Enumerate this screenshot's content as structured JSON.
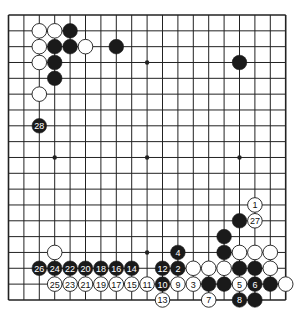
{
  "board": {
    "size": 19,
    "colors": {
      "background": "#ffffff",
      "line": "#222222",
      "black_stone": "#1a1a1a",
      "white_stone": "#ffffff",
      "black_label": "#ffffff",
      "white_label": "#111111"
    },
    "star_points": [
      [
        3,
        3
      ],
      [
        9,
        3
      ],
      [
        15,
        3
      ],
      [
        3,
        9
      ],
      [
        9,
        9
      ],
      [
        15,
        9
      ],
      [
        3,
        15
      ],
      [
        9,
        15
      ],
      [
        15,
        15
      ]
    ],
    "stones": [
      {
        "color": "black",
        "col": 4,
        "row": 1,
        "label": ""
      },
      {
        "color": "black",
        "col": 3,
        "row": 2,
        "label": ""
      },
      {
        "color": "black",
        "col": 4,
        "row": 2,
        "label": ""
      },
      {
        "color": "black",
        "col": 7,
        "row": 2,
        "label": ""
      },
      {
        "color": "black",
        "col": 3,
        "row": 3,
        "label": ""
      },
      {
        "color": "black",
        "col": 3,
        "row": 4,
        "label": ""
      },
      {
        "color": "black",
        "col": 15,
        "row": 3,
        "label": ""
      },
      {
        "color": "black",
        "col": 15,
        "row": 13,
        "label": ""
      },
      {
        "color": "black",
        "col": 14,
        "row": 14,
        "label": ""
      },
      {
        "color": "black",
        "col": 14,
        "row": 15,
        "label": ""
      },
      {
        "color": "black",
        "col": 15,
        "row": 16,
        "label": ""
      },
      {
        "color": "black",
        "col": 16,
        "row": 16,
        "label": ""
      },
      {
        "color": "black",
        "col": 13,
        "row": 17,
        "label": ""
      },
      {
        "color": "black",
        "col": 14,
        "row": 17,
        "label": ""
      },
      {
        "color": "black",
        "col": 17,
        "row": 17,
        "label": ""
      },
      {
        "color": "black",
        "col": 16,
        "row": 18,
        "label": ""
      },
      {
        "color": "white",
        "col": 2,
        "row": 1,
        "label": ""
      },
      {
        "color": "white",
        "col": 3,
        "row": 1,
        "label": ""
      },
      {
        "color": "white",
        "col": 2,
        "row": 2,
        "label": ""
      },
      {
        "color": "white",
        "col": 5,
        "row": 2,
        "label": ""
      },
      {
        "color": "white",
        "col": 2,
        "row": 3,
        "label": ""
      },
      {
        "color": "white",
        "col": 2,
        "row": 5,
        "label": ""
      },
      {
        "color": "white",
        "col": 3,
        "row": 15,
        "label": ""
      },
      {
        "color": "white",
        "col": 15,
        "row": 15,
        "label": ""
      },
      {
        "color": "white",
        "col": 16,
        "row": 15,
        "label": ""
      },
      {
        "color": "white",
        "col": 17,
        "row": 15,
        "label": ""
      },
      {
        "color": "white",
        "col": 12,
        "row": 16,
        "label": ""
      },
      {
        "color": "white",
        "col": 13,
        "row": 16,
        "label": ""
      },
      {
        "color": "white",
        "col": 14,
        "row": 16,
        "label": ""
      },
      {
        "color": "white",
        "col": 17,
        "row": 16,
        "label": ""
      },
      {
        "color": "white",
        "col": 18,
        "row": 17,
        "label": ""
      },
      {
        "color": "white",
        "col": 16,
        "row": 12,
        "label": "1"
      },
      {
        "color": "black",
        "col": 11,
        "row": 16,
        "label": "2"
      },
      {
        "color": "white",
        "col": 12,
        "row": 17,
        "label": "3"
      },
      {
        "color": "black",
        "col": 11,
        "row": 15,
        "label": "4"
      },
      {
        "color": "white",
        "col": 15,
        "row": 17,
        "label": "5"
      },
      {
        "color": "black",
        "col": 16,
        "row": 17,
        "label": "6"
      },
      {
        "color": "white",
        "col": 13,
        "row": 18,
        "label": "7"
      },
      {
        "color": "black",
        "col": 15,
        "row": 18,
        "label": "8"
      },
      {
        "color": "white",
        "col": 11,
        "row": 17,
        "label": "9"
      },
      {
        "color": "black",
        "col": 10,
        "row": 17,
        "label": "10"
      },
      {
        "color": "white",
        "col": 9,
        "row": 17,
        "label": "11"
      },
      {
        "color": "black",
        "col": 10,
        "row": 16,
        "label": "12"
      },
      {
        "color": "white",
        "col": 10,
        "row": 18,
        "label": "13"
      },
      {
        "color": "black",
        "col": 8,
        "row": 16,
        "label": "14"
      },
      {
        "color": "white",
        "col": 8,
        "row": 17,
        "label": "15"
      },
      {
        "color": "black",
        "col": 7,
        "row": 16,
        "label": "16"
      },
      {
        "color": "white",
        "col": 7,
        "row": 17,
        "label": "17"
      },
      {
        "color": "black",
        "col": 6,
        "row": 16,
        "label": "18"
      },
      {
        "color": "white",
        "col": 6,
        "row": 17,
        "label": "19"
      },
      {
        "color": "black",
        "col": 5,
        "row": 16,
        "label": "20"
      },
      {
        "color": "white",
        "col": 5,
        "row": 17,
        "label": "21"
      },
      {
        "color": "black",
        "col": 4,
        "row": 16,
        "label": "22"
      },
      {
        "color": "white",
        "col": 4,
        "row": 17,
        "label": "23"
      },
      {
        "color": "black",
        "col": 3,
        "row": 16,
        "label": "24"
      },
      {
        "color": "white",
        "col": 3,
        "row": 17,
        "label": "25"
      },
      {
        "color": "black",
        "col": 2,
        "row": 16,
        "label": "26"
      },
      {
        "color": "white",
        "col": 16,
        "row": 13,
        "label": "27"
      },
      {
        "color": "black",
        "col": 2,
        "row": 7,
        "label": "28"
      }
    ]
  }
}
